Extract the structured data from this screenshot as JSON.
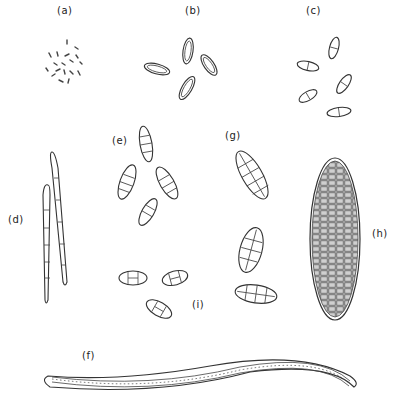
{
  "figure": {
    "labels": [
      {
        "id": "a",
        "text": "(a)",
        "x": 57,
        "y": 5
      },
      {
        "id": "b",
        "text": "(b)",
        "x": 185,
        "y": 5
      },
      {
        "id": "c",
        "text": "(c)",
        "x": 306,
        "y": 5
      },
      {
        "id": "d",
        "text": "(d)",
        "x": 8,
        "y": 214
      },
      {
        "id": "e",
        "text": "(e)",
        "x": 112,
        "y": 135
      },
      {
        "id": "g",
        "text": "(g)",
        "x": 225,
        "y": 130
      },
      {
        "id": "h",
        "text": "(h)",
        "x": 372,
        "y": 228
      },
      {
        "id": "i",
        "text": "(i)",
        "x": 192,
        "y": 299
      },
      {
        "id": "f",
        "text": "(f)",
        "x": 82,
        "y": 350
      }
    ],
    "colors": {
      "line": "#333333",
      "background": "#ffffff",
      "fill_h": "#bdbdbd"
    }
  }
}
